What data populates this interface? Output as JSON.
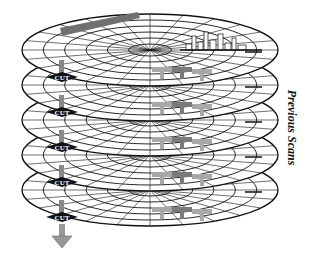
{
  "diagram": {
    "title_label": "Previous Scans",
    "planes": [
      {
        "index": 0,
        "cut_label": "CUT",
        "cy": 50
      },
      {
        "index": 1,
        "cut_label": "CUT",
        "cy": 85
      },
      {
        "index": 2,
        "cut_label": "CUT",
        "cy": 120
      },
      {
        "index": 3,
        "cut_label": "CUT",
        "cy": 155
      },
      {
        "index": 4,
        "cut_label": "CUT",
        "cy": 190
      }
    ],
    "plane_count": 5,
    "arrow_direction": "down",
    "colors": {
      "grid_line": "#111111",
      "cut_badge": "#111111",
      "cut_bar": "#888888",
      "aircraft": "#7a7a7a",
      "aircraft_light": "#a8a8a8",
      "ship": "#707070",
      "arrow": "#999999"
    }
  }
}
